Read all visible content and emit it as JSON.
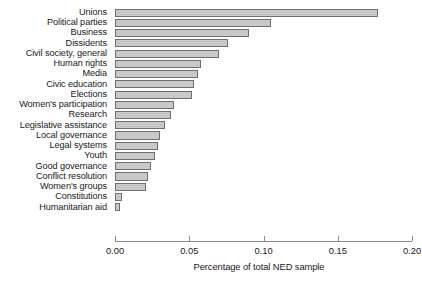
{
  "chart_data": {
    "type": "bar",
    "orientation": "horizontal",
    "title": "",
    "xlabel": "Percentage of total NED sample",
    "ylabel": "",
    "xlim": [
      0.0,
      0.2
    ],
    "xticks": [
      "0.00",
      "0.05",
      "0.10",
      "0.15",
      "0.20"
    ],
    "xtick_values": [
      0.0,
      0.05,
      0.1,
      0.15,
      0.2
    ],
    "grid": false,
    "legend": null,
    "bar_color": "#c9c9c9",
    "bar_edge_color": "#6f6f6f",
    "categories": [
      "Unions",
      "Political parties",
      "Business",
      "Dissidents",
      "Civil society, general",
      "Human rights",
      "Media",
      "Civic education",
      "Elections",
      "Women's participation",
      "Research",
      "Legislative assistance",
      "Local governance",
      "Legal systems",
      "Youth",
      "Good governance",
      "Conflict resolution",
      "Women's groups",
      "Constitutions",
      "Humanitarian aid"
    ],
    "values": [
      0.177,
      0.105,
      0.09,
      0.076,
      0.07,
      0.058,
      0.056,
      0.053,
      0.052,
      0.04,
      0.038,
      0.034,
      0.03,
      0.029,
      0.027,
      0.024,
      0.022,
      0.021,
      0.005,
      0.003
    ]
  }
}
